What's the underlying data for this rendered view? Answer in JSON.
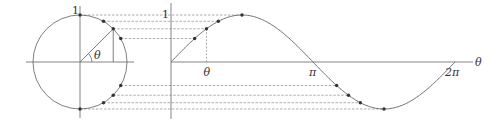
{
  "figure": {
    "colors": {
      "line": "#707070",
      "axis": "#777777",
      "dash": "#8a8a8a",
      "dot": "#333333",
      "text": "#333333"
    },
    "circle": {
      "center": [
        80,
        62
      ],
      "radius": 47,
      "label_one": "1",
      "angle_label": "θ",
      "sample_angles_deg": [
        90,
        60,
        45,
        30,
        -30,
        -45,
        -60,
        -90
      ],
      "highlight_angle_deg": 45
    },
    "graph": {
      "origin": [
        171,
        62
      ],
      "pi_px": 142,
      "amplitude_px": 47,
      "y_label_one": "1",
      "x_axis_label": "θ",
      "ticks": [
        {
          "label": "θ",
          "value_deg": 45
        },
        {
          "label": "π",
          "value_deg": 180
        },
        {
          "label": "2π",
          "value_deg": 360
        }
      ]
    }
  }
}
